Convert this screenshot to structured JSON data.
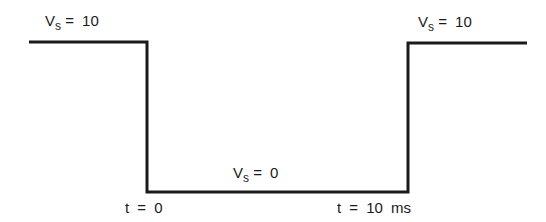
{
  "diagram": {
    "type": "voltage-step-waveform",
    "stroke_color": "#1a1a1a",
    "labels": {
      "left_level": {
        "var": "V",
        "sub": "s",
        "rest": "= 10"
      },
      "right_level": {
        "var": "V",
        "sub": "s",
        "rest": "= 10"
      },
      "low_level": {
        "var": "V",
        "sub": "s",
        "rest": "= 0"
      },
      "t_start": "t = 0",
      "t_end": "t = 10 ms"
    },
    "segments": [
      {
        "name": "high-before",
        "value": 10
      },
      {
        "name": "low",
        "value": 0,
        "from": "t = 0",
        "to": "t = 10 ms"
      },
      {
        "name": "high-after",
        "value": 10
      }
    ]
  }
}
